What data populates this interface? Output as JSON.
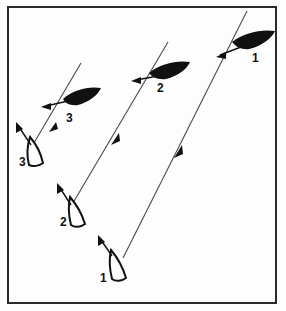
{
  "figure": {
    "background_color": "#fdfdfd",
    "ink_color": "#111111",
    "border": {
      "name": "figure-border",
      "x": 8,
      "y": 7,
      "width": 268,
      "height": 296,
      "stroke": "#2a2a2a",
      "stroke_width": 2
    },
    "course_lines": [
      {
        "id": "track-right",
        "label": "1",
        "x1": 247,
        "y1": 11,
        "x2": 123,
        "y2": 258,
        "stroke": "#4a4a4a",
        "stroke_width": 1.1,
        "midpoint_arrow": {
          "x": 179,
          "y": 151,
          "direction": "up-right"
        }
      },
      {
        "id": "track-middle",
        "label": "2",
        "x1": 168,
        "y1": 42,
        "x2": 70,
        "y2": 208,
        "stroke": "#4a4a4a",
        "stroke_width": 1.1,
        "midpoint_arrow": {
          "x": 116,
          "y": 139,
          "direction": "up-right"
        }
      },
      {
        "id": "track-left",
        "label": "3",
        "x1": 81,
        "y1": 63,
        "x2": 31,
        "y2": 148,
        "stroke": "#4a4a4a",
        "stroke_width": 1.1,
        "midpoint_arrow": {
          "x": 53,
          "y": 127,
          "direction": "up-right"
        }
      }
    ],
    "dark_boats": [
      {
        "id": "dark-boat-1",
        "label": "1",
        "label_x": 256,
        "label_y": 57,
        "fill": "#111111",
        "note": "filled wedge hull heading right, upper right of frame"
      },
      {
        "id": "dark-boat-2",
        "label": "2",
        "label_x": 161,
        "label_y": 88,
        "fill": "#111111",
        "note": "filled wedge hull heading right, upper middle of frame"
      },
      {
        "id": "dark-boat-3",
        "label": "3",
        "label_x": 70,
        "label_y": 118,
        "fill": "#111111",
        "note": "filled wedge hull heading right, upper left of frame"
      }
    ],
    "outline_boats": [
      {
        "id": "outline-boat-1",
        "label": "1",
        "label_x": 104,
        "label_y": 278,
        "stroke": "#111111",
        "fill": "#ffffff",
        "note": "open hull outline, bottom of frame"
      },
      {
        "id": "outline-boat-2",
        "label": "2",
        "label_x": 64,
        "label_y": 222,
        "stroke": "#111111",
        "fill": "#ffffff",
        "note": "open hull outline, lower left middle of frame"
      },
      {
        "id": "outline-boat-3",
        "label": "3",
        "label_x": 23,
        "label_y": 161,
        "stroke": "#111111",
        "fill": "#ffffff",
        "note": "open hull outline, left of frame"
      }
    ],
    "wind_arrows": [
      {
        "id": "wind-arrow-dark-1",
        "x1": 240,
        "y1": 48,
        "x2": 219,
        "y2": 57,
        "direction": "left"
      },
      {
        "id": "wind-arrow-dark-2",
        "x1": 158,
        "y1": 76,
        "x2": 133,
        "y2": 81,
        "direction": "left"
      },
      {
        "id": "wind-arrow-dark-3",
        "x1": 68,
        "y1": 101,
        "x2": 44,
        "y2": 108,
        "direction": "left"
      },
      {
        "id": "wind-arrow-outline-1",
        "x1": 113,
        "y1": 257,
        "x2": 100,
        "y2": 240,
        "direction": "up-left"
      },
      {
        "id": "wind-arrow-outline-2",
        "x1": 72,
        "y1": 206,
        "x2": 59,
        "y2": 187,
        "direction": "up-left"
      },
      {
        "id": "wind-arrow-outline-3",
        "x1": 32,
        "y1": 146,
        "x2": 17,
        "y2": 124,
        "direction": "up-left"
      }
    ]
  }
}
